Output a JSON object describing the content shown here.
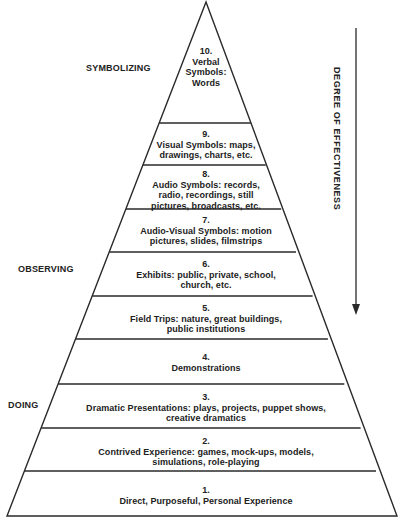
{
  "diagram": {
    "type": "pyramid",
    "stage_labels": {
      "symbolizing": "SYMBOLIZING",
      "observing": "OBSERVING",
      "doing": "DOING"
    },
    "axis_label": "DEGREE OF EFFECTIVENESS",
    "arrow_direction": "down",
    "bands": [
      {
        "number": "10.",
        "lines": [
          "Verbal",
          "Symbols:",
          "Words"
        ]
      },
      {
        "number": "9.",
        "lines": [
          "Visual Symbols: maps,",
          "drawings, charts, etc."
        ]
      },
      {
        "number": "8.",
        "lines": [
          "Audio Symbols: records,",
          "radio, recordings, still",
          "pictures, broadcasts, etc."
        ]
      },
      {
        "number": "7.",
        "lines": [
          "Audio-Visual Symbols: motion",
          "pictures, slides, filmstrips"
        ]
      },
      {
        "number": "6.",
        "lines": [
          "Exhibits: public, private, school,",
          "church, etc."
        ]
      },
      {
        "number": "5.",
        "lines": [
          "Field Trips: nature, great buildings,",
          "public institutions"
        ]
      },
      {
        "number": "4.",
        "lines": [
          "Demonstrations"
        ]
      },
      {
        "number": "3.",
        "lines": [
          "Dramatic Presentations: plays, projects, puppet shows,",
          "creative dramatics"
        ]
      },
      {
        "number": "2.",
        "lines": [
          "Contrived Experience: games, mock-ups, models,",
          "simulations, role-playing"
        ]
      },
      {
        "number": "1.",
        "lines": [
          "Direct, Purposeful, Personal Experience"
        ]
      }
    ],
    "colors": {
      "line": "#2a2a2a",
      "text": "#222222",
      "background": "#ffffff"
    }
  }
}
